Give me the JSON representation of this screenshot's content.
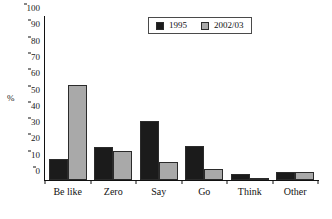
{
  "chart_data": {
    "type": "bar",
    "title": "",
    "subtitle": "",
    "xlabel": "",
    "ylabel": "%",
    "ylim": [
      0,
      100
    ],
    "yticks": [
      0,
      10,
      20,
      30,
      40,
      50,
      60,
      70,
      80,
      90,
      100
    ],
    "ytick_labels": [
      "0",
      "10",
      "20",
      "30",
      "40",
      "50",
      "60",
      "70",
      "80",
      "90",
      "100"
    ],
    "grid": false,
    "legend_position": "top-center",
    "categories": [
      "Be like",
      "Zero",
      "Say",
      "Go",
      "Think",
      "Other"
    ],
    "series": [
      {
        "name": "1995",
        "color": "#1b1b1b",
        "values": [
          13,
          20,
          36,
          21,
          3.5,
          5
        ]
      },
      {
        "name": "2002/03",
        "color": "#a9a9a9",
        "values": [
          58,
          18,
          11,
          6.5,
          1.5,
          5
        ]
      }
    ]
  },
  "legend": {
    "items": [
      {
        "label": "1995",
        "swatch": "legend-swatch-1995"
      },
      {
        "label": "2002/03",
        "swatch": "legend-swatch-2002-03"
      }
    ]
  },
  "axes": {
    "y_unit_label": "%"
  }
}
